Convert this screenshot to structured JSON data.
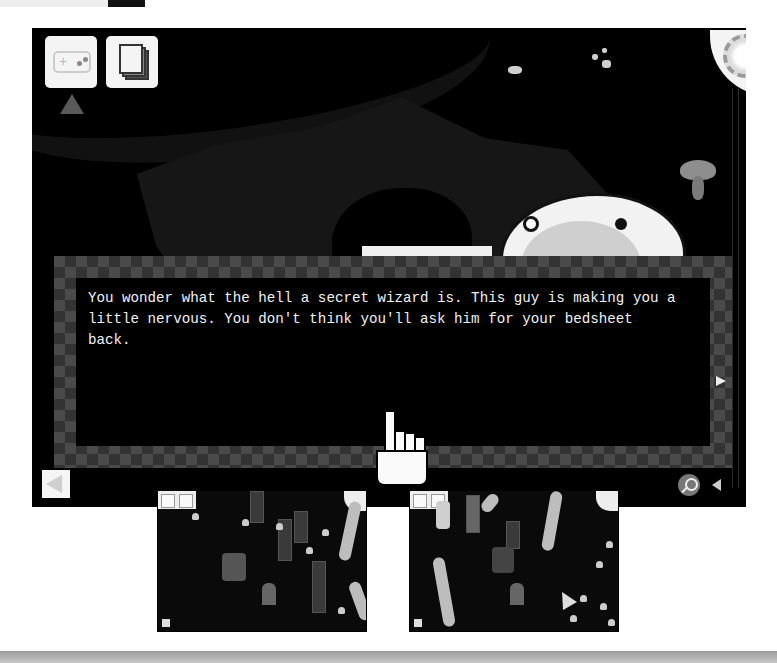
{
  "dialog": {
    "text": "You wonder what the hell a secret wizard is. This guy is making you a\nlittle nervous. You don't think you'll ask him for your bedsheet\nback."
  },
  "hud": {
    "controller_button": "gamepad-icon",
    "journal_button": "pages-icon",
    "menu_orb": "orb-icon",
    "back_button": "left-arrow-icon",
    "zoom_button": "magnifier-icon",
    "sound_button": "speaker-icon",
    "next_arrow": "right-arrow-icon"
  },
  "thumbnails": [
    {
      "label": "scene-forest-pillars"
    },
    {
      "label": "scene-forest-trees"
    }
  ],
  "colors": {
    "game_bg": "#000000",
    "dialog_border_light": "#4a4a4a",
    "dialog_border_dark": "#333333",
    "dialog_text": "#f2f2f2",
    "hud_button": "#f4f4f4"
  }
}
